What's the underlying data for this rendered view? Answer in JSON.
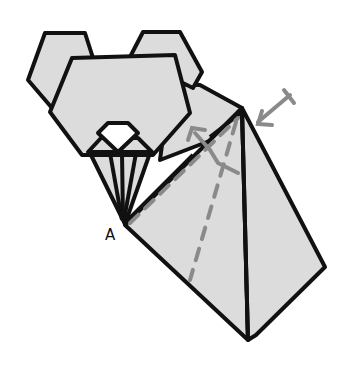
{
  "diagram": {
    "labels": {
      "point_a": "A"
    },
    "colors": {
      "paper": "#dcdcdc",
      "outline": "#111111",
      "guide": "#8a8a8a",
      "nose": "#ffffff",
      "background": "#ffffff"
    },
    "annotations": [
      {
        "type": "valley-fold-line",
        "description": "dashed line from point A to apex"
      },
      {
        "type": "valley-fold-line",
        "description": "dashed line from apex down the left flap"
      },
      {
        "type": "fold-arrow",
        "description": "curved arrow folding flap up-left"
      },
      {
        "type": "press-arrow",
        "description": "arrow pointing at apex (push / sink)"
      }
    ]
  }
}
